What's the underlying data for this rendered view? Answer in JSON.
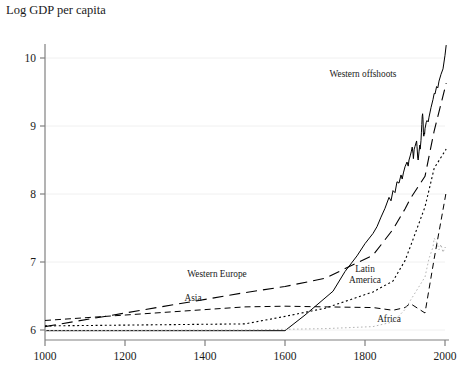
{
  "chart_data": {
    "type": "line",
    "title": "Log GDP per capita",
    "xlabel": "",
    "ylabel": "",
    "xlim": [
      1000,
      2000
    ],
    "ylim": [
      5.82,
      10.45
    ],
    "grid": true,
    "grid_axis": "y",
    "legend_position": "inline-annotations",
    "xticks": [
      1000,
      1200,
      1400,
      1600,
      1800,
      2000
    ],
    "xtick_labels": [
      "1000",
      "1200",
      "1400",
      "1600",
      "1800",
      "2000"
    ],
    "yticks": [
      6,
      7,
      8,
      9,
      10
    ],
    "ytick_labels": [
      "6",
      "7",
      "8",
      "9",
      "10"
    ],
    "series": [
      {
        "name": "Western offshoots",
        "label": "Western offshoots",
        "style": "solid",
        "color": "#000000",
        "width": 1.0,
        "label_xy": [
          1795,
          9.72
        ],
        "points": [
          [
            1000,
            5.99
          ],
          [
            1100,
            5.99
          ],
          [
            1200,
            5.99
          ],
          [
            1300,
            5.99
          ],
          [
            1400,
            5.99
          ],
          [
            1500,
            5.99
          ],
          [
            1600,
            5.99
          ],
          [
            1650,
            6.22
          ],
          [
            1700,
            6.47
          ],
          [
            1720,
            6.57
          ],
          [
            1750,
            6.86
          ],
          [
            1780,
            7.09
          ],
          [
            1800,
            7.27
          ],
          [
            1820,
            7.42
          ],
          [
            1830,
            7.52
          ],
          [
            1840,
            7.66
          ],
          [
            1850,
            7.79
          ],
          [
            1860,
            7.95
          ],
          [
            1865,
            7.9
          ],
          [
            1870,
            8.05
          ],
          [
            1875,
            8.02
          ],
          [
            1880,
            8.18
          ],
          [
            1885,
            8.16
          ],
          [
            1890,
            8.28
          ],
          [
            1893,
            8.22
          ],
          [
            1896,
            8.31
          ],
          [
            1900,
            8.4
          ],
          [
            1905,
            8.47
          ],
          [
            1908,
            8.41
          ],
          [
            1910,
            8.5
          ],
          [
            1913,
            8.56
          ],
          [
            1916,
            8.63
          ],
          [
            1918,
            8.69
          ],
          [
            1920,
            8.6
          ],
          [
            1921,
            8.52
          ],
          [
            1923,
            8.66
          ],
          [
            1925,
            8.7
          ],
          [
            1929,
            8.78
          ],
          [
            1930,
            8.7
          ],
          [
            1932,
            8.52
          ],
          [
            1933,
            8.5
          ],
          [
            1935,
            8.62
          ],
          [
            1937,
            8.72
          ],
          [
            1938,
            8.66
          ],
          [
            1940,
            8.79
          ],
          [
            1941,
            8.9
          ],
          [
            1942,
            9.02
          ],
          [
            1943,
            9.14
          ],
          [
            1944,
            9.18
          ],
          [
            1945,
            9.1
          ],
          [
            1946,
            8.9
          ],
          [
            1947,
            8.85
          ],
          [
            1948,
            8.9
          ],
          [
            1949,
            8.88
          ],
          [
            1950,
            8.96
          ],
          [
            1953,
            9.05
          ],
          [
            1955,
            9.08
          ],
          [
            1958,
            9.06
          ],
          [
            1960,
            9.13
          ],
          [
            1965,
            9.27
          ],
          [
            1970,
            9.39
          ],
          [
            1973,
            9.48
          ],
          [
            1975,
            9.47
          ],
          [
            1979,
            9.58
          ],
          [
            1982,
            9.56
          ],
          [
            1985,
            9.66
          ],
          [
            1990,
            9.76
          ],
          [
            1995,
            9.84
          ],
          [
            2000,
            10.04
          ],
          [
            2003,
            10.19
          ]
        ]
      },
      {
        "name": "Western Europe",
        "label": "Western Europe",
        "style": "long-dash",
        "color": "#000000",
        "width": 1.1,
        "label_xy": [
          1430,
          6.78
        ],
        "points": [
          [
            1000,
            6.05
          ],
          [
            1500,
            6.55
          ],
          [
            1600,
            6.64
          ],
          [
            1700,
            6.76
          ],
          [
            1820,
            7.1
          ],
          [
            1870,
            7.48
          ],
          [
            1900,
            7.78
          ],
          [
            1913,
            7.93
          ],
          [
            1950,
            8.26
          ],
          [
            1973,
            8.93
          ],
          [
            2003,
            9.63
          ]
        ]
      },
      {
        "name": "Asia",
        "label": "Asia",
        "style": "dash",
        "color": "#000000",
        "width": 1.0,
        "label_xy": [
          1370,
          6.42
        ],
        "points": [
          [
            1000,
            6.14
          ],
          [
            1500,
            6.34
          ],
          [
            1600,
            6.35
          ],
          [
            1700,
            6.34
          ],
          [
            1820,
            6.33
          ],
          [
            1870,
            6.29
          ],
          [
            1900,
            6.33
          ],
          [
            1913,
            6.39
          ],
          [
            1950,
            6.25
          ],
          [
            1973,
            7.05
          ],
          [
            2003,
            8.03
          ]
        ]
      },
      {
        "name": "Latin America",
        "label": "Latin America",
        "style": "dot",
        "color": "#000000",
        "width": 1.1,
        "label_xy": [
          1800,
          6.86
        ],
        "points": [
          [
            1000,
            6.06
          ],
          [
            1500,
            6.09
          ],
          [
            1600,
            6.2
          ],
          [
            1700,
            6.32
          ],
          [
            1820,
            6.56
          ],
          [
            1870,
            6.72
          ],
          [
            1900,
            7.02
          ],
          [
            1913,
            7.22
          ],
          [
            1950,
            7.81
          ],
          [
            1973,
            8.38
          ],
          [
            2003,
            8.66
          ]
        ]
      },
      {
        "name": "Africa",
        "label": "Africa",
        "style": "dot-light",
        "color": "#b5b5b5",
        "width": 1.0,
        "label_xy": [
          1860,
          6.12
        ],
        "points": [
          [
            1000,
            5.99
          ],
          [
            1500,
            6.0
          ],
          [
            1600,
            6.01
          ],
          [
            1700,
            6.02
          ],
          [
            1820,
            6.05
          ],
          [
            1870,
            6.12
          ],
          [
            1900,
            6.3
          ],
          [
            1913,
            6.43
          ],
          [
            1950,
            6.78
          ],
          [
            1960,
            7.05
          ],
          [
            1970,
            7.22
          ],
          [
            1973,
            7.35
          ],
          [
            1980,
            7.28
          ],
          [
            1985,
            7.18
          ],
          [
            1990,
            7.26
          ],
          [
            1995,
            7.14
          ],
          [
            2000,
            7.22
          ],
          [
            2003,
            7.2
          ]
        ]
      }
    ]
  }
}
